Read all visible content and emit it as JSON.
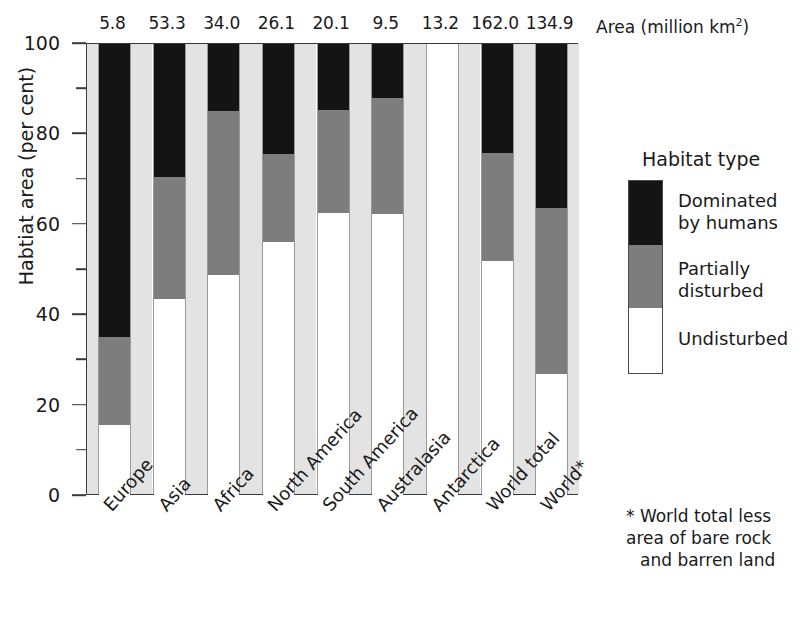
{
  "chart_data": {
    "type": "bar",
    "subtype": "stacked-bar-100-percent",
    "title": "",
    "xlabel": "",
    "ylabel": "Habtiat area (per cent)",
    "ylim": [
      0,
      100
    ],
    "yticks_major": [
      0,
      20,
      40,
      60,
      80,
      100
    ],
    "yticks_minor": [
      10,
      30,
      50,
      70,
      90
    ],
    "ytick_labels": [
      "0",
      "20",
      "40",
      "60",
      "80",
      "100"
    ],
    "grid": false,
    "legend_position": "right",
    "secondary_axis_title": "Area (million km",
    "secondary_axis_title_sup": "2",
    "secondary_axis_title_close": ")",
    "categories": [
      "Europe",
      "Asia",
      "Africa",
      "North America",
      "South America",
      "Australasia",
      "Antarctica",
      "World total",
      "World*"
    ],
    "area_values": [
      "5.8",
      "53.3",
      "34.0",
      "26.1",
      "20.1",
      "9.5",
      "13.2",
      "162.0",
      "134.9"
    ],
    "area_values_numeric": [
      5.8,
      53.3,
      34.0,
      26.1,
      20.1,
      9.5,
      13.2,
      162.0,
      134.9
    ],
    "series": [
      {
        "name": "Undisturbed",
        "color": "#ffffff",
        "values": [
          15.6,
          43.5,
          48.9,
          56.3,
          62.5,
          62.3,
          100.0,
          51.9,
          27.0
        ]
      },
      {
        "name": "Partially disturbed",
        "color": "#7d7d7d",
        "values": [
          19.6,
          27.0,
          36.2,
          19.3,
          22.8,
          25.7,
          0.0,
          23.9,
          36.8
        ]
      },
      {
        "name": "Dominated by humans",
        "color": "#141414",
        "values": [
          64.8,
          29.5,
          14.9,
          24.4,
          14.7,
          12.0,
          0.0,
          24.2,
          36.2
        ]
      }
    ],
    "stack_tops": {
      "undisturbed_top": [
        15.6,
        43.5,
        48.9,
        56.3,
        62.5,
        62.3,
        100.0,
        51.9,
        27.0
      ],
      "partial_top": [
        35.2,
        70.5,
        85.1,
        75.6,
        85.3,
        88.0,
        100.0,
        75.8,
        63.8
      ]
    }
  },
  "legend": {
    "title": "Habitat type",
    "items": [
      {
        "label_lines": [
          "Dominated",
          "by humans"
        ],
        "color": "#141414"
      },
      {
        "label_lines": [
          "Partially",
          "disturbed"
        ],
        "color": "#7d7d7d"
      },
      {
        "label_lines": [
          "Undisturbed"
        ],
        "color": "#ffffff"
      }
    ]
  },
  "footnote": {
    "lines": [
      "* World total less",
      "area of bare rock",
      "and barren land"
    ]
  }
}
